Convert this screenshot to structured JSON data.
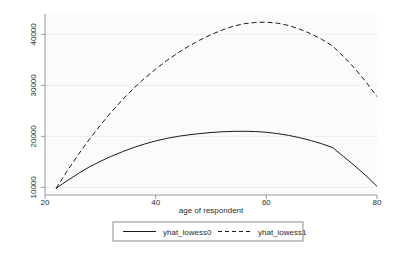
{
  "chart_data": {
    "type": "line",
    "title": "",
    "subtitle": "",
    "xlabel": "age of respondent",
    "ylabel": "",
    "xlim": [
      20,
      80
    ],
    "ylim": [
      8500,
      44000
    ],
    "xticks": [
      20,
      40,
      60,
      80
    ],
    "xtick_labels": [
      "20",
      "40",
      "60",
      "80"
    ],
    "yticks": [
      10000,
      20000,
      30000,
      40000
    ],
    "ytick_labels": [
      "10000",
      "20000",
      "30000",
      "40000"
    ],
    "grid": "horizontal",
    "legend_position": "bottom",
    "x": [
      22,
      24,
      26,
      28,
      30,
      32,
      34,
      36,
      38,
      40,
      42,
      44,
      46,
      48,
      50,
      52,
      54,
      56,
      58,
      60,
      62,
      64,
      66,
      68,
      70,
      72,
      74,
      76,
      78,
      80
    ],
    "series": [
      {
        "name": "yhat_lowess0",
        "style": "solid",
        "color": "#1a1a1a",
        "values": [
          9800,
          11300,
          12700,
          14000,
          15100,
          16100,
          17000,
          17800,
          18500,
          19100,
          19600,
          20000,
          20300,
          20550,
          20750,
          20900,
          20980,
          21000,
          20950,
          20800,
          20550,
          20200,
          19750,
          19200,
          18550,
          17800,
          16000,
          14200,
          12300,
          10200
        ]
      },
      {
        "name": "yhat_lowess1",
        "style": "dashed",
        "color": "#1a1a1a",
        "values": [
          9800,
          13200,
          16400,
          19400,
          22200,
          24800,
          27200,
          29400,
          31400,
          33200,
          34850,
          36350,
          37700,
          38900,
          39950,
          40850,
          41600,
          42100,
          42350,
          42400,
          42200,
          41750,
          41050,
          40150,
          39050,
          37700,
          35600,
          33300,
          30700,
          27800
        ]
      }
    ],
    "annotations": []
  },
  "legend": {
    "items": [
      {
        "label": "yhat_lowess0",
        "style": "solid"
      },
      {
        "label": "yhat_lowess1",
        "style": "dashed"
      }
    ]
  }
}
